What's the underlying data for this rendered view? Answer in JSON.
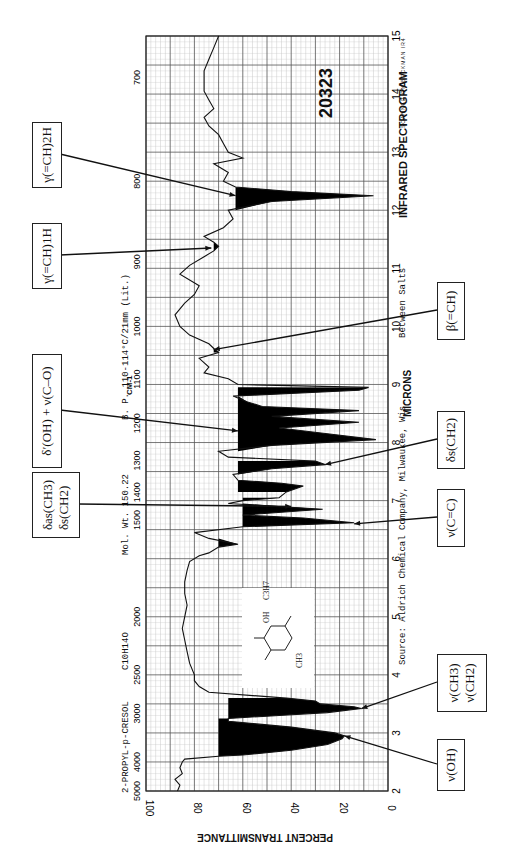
{
  "header": {
    "catalog_number": "20323",
    "title": "INFRARED SPECTROGRAM",
    "instrument": "SCANNED ON BECKMAN IR4",
    "compound": "2-PROPYL-p-CRESOL",
    "formula": "C10H14O",
    "mol_wt": "Mol. Wt. 150.22",
    "bp": "B. P. 110-114°C/21mm (Lit.)",
    "sample": "Between Salts",
    "source": "Source: Aldrich Chemical Company, Milwaukee, Wis."
  },
  "structure": {
    "substituents": [
      "OH",
      "C3H7",
      "CH3"
    ]
  },
  "annotations": [
    {
      "id": "gamma-ch-2h",
      "label": "γ(=CH)2H",
      "micron": 12.25,
      "T": 63
    },
    {
      "id": "gamma-ch-1h",
      "label": "γ(=CH)1H",
      "micron": 11.35,
      "T": 73
    },
    {
      "id": "delta-oh-nu-co",
      "label": "δ′(OH) + ν(C–O)",
      "micron": 8.2,
      "T": 62
    },
    {
      "id": "delta-as-ch3",
      "label": "δas(CH3)",
      "label2": "δs(CH2)",
      "micron": 6.9,
      "T": 40
    },
    {
      "id": "beta-ch",
      "label": "β(=CH)",
      "micron": 9.6,
      "T": 72
    },
    {
      "id": "delta-s-ch2",
      "label": "δs(CH2)",
      "micron": 7.62,
      "T": 26
    },
    {
      "id": "nu-cc",
      "label": "ν(C=C)",
      "micron": 6.6,
      "T": 14
    },
    {
      "id": "nu-ch3-ch2",
      "label": "ν(CH3)",
      "label2": "ν(CH2)",
      "micron": 3.42,
      "T": 11
    },
    {
      "id": "nu-oh",
      "label": "ν(OH)",
      "micron": 2.95,
      "T": 18
    }
  ],
  "chart_data": {
    "type": "line",
    "xlabel": "MICRONS",
    "x2label": "CM-1",
    "ylabel": "PERCENT TRANSMITTANCE",
    "xlim": [
      2,
      15
    ],
    "ylim": [
      0,
      100
    ],
    "micron_ticks": [
      2,
      3,
      4,
      5,
      6,
      7,
      8,
      9,
      10,
      11,
      12,
      13,
      14,
      15
    ],
    "wavenumber_ticks": [
      5000,
      4000,
      3000,
      2500,
      2000,
      1500,
      1400,
      1300,
      1200,
      1100,
      1000,
      900,
      800,
      700
    ],
    "percent_ticks": [
      100,
      80,
      60,
      40,
      20,
      0
    ],
    "grid": true,
    "series": [
      {
        "name": "Transmittance",
        "x": [
          2.0,
          2.1,
          2.2,
          2.3,
          2.4,
          2.5,
          2.55,
          2.6,
          2.62,
          2.7,
          2.8,
          2.9,
          2.95,
          3.0,
          3.1,
          3.2,
          3.25,
          3.3,
          3.35,
          3.42,
          3.45,
          3.5,
          3.55,
          3.6,
          3.7,
          3.8,
          3.9,
          4.0,
          4.2,
          4.4,
          4.6,
          4.8,
          5.0,
          5.2,
          5.4,
          5.6,
          5.8,
          5.95,
          6.05,
          6.1,
          6.2,
          6.25,
          6.35,
          6.45,
          6.55,
          6.62,
          6.7,
          6.75,
          6.85,
          6.95,
          7.0,
          7.05,
          7.15,
          7.25,
          7.3,
          7.35,
          7.45,
          7.55,
          7.62,
          7.68,
          7.75,
          7.85,
          7.95,
          8.05,
          8.15,
          8.25,
          8.35,
          8.45,
          8.55,
          8.62,
          8.7,
          8.8,
          8.9,
          8.95,
          9.0,
          9.1,
          9.2,
          9.3,
          9.45,
          9.55,
          9.62,
          9.7,
          9.85,
          10.0,
          10.2,
          10.4,
          10.55,
          10.7,
          10.9,
          11.05,
          11.2,
          11.3,
          11.38,
          11.45,
          11.55,
          11.7,
          11.85,
          12.0,
          12.15,
          12.25,
          12.32,
          12.4,
          12.5,
          12.65,
          12.8,
          12.9,
          13.0,
          13.15,
          13.3,
          13.45,
          13.6,
          13.75,
          13.9,
          14.05,
          14.2,
          14.4,
          14.6,
          14.8,
          15.0
        ],
        "y": [
          87,
          86,
          88,
          85,
          86,
          85,
          84,
          70,
          60,
          40,
          25,
          19,
          18,
          22,
          40,
          66,
          66,
          45,
          25,
          11,
          14,
          28,
          30,
          42,
          74,
          78,
          80,
          80,
          82,
          83,
          84,
          85,
          84,
          83,
          84,
          84,
          83,
          82,
          78,
          74,
          70,
          62,
          74,
          80,
          60,
          14,
          35,
          60,
          27,
          66,
          60,
          45,
          42,
          35,
          44,
          62,
          64,
          48,
          26,
          30,
          66,
          70,
          48,
          5,
          25,
          45,
          12,
          48,
          12,
          52,
          58,
          64,
          12,
          8,
          62,
          66,
          76,
          74,
          78,
          70,
          72,
          74,
          82,
          86,
          88,
          84,
          80,
          78,
          86,
          82,
          76,
          72,
          70,
          72,
          76,
          68,
          64,
          66,
          48,
          6,
          40,
          63,
          68,
          66,
          72,
          60,
          66,
          68,
          70,
          74,
          76,
          72,
          74,
          76,
          76,
          76,
          74,
          72,
          70
        ]
      }
    ]
  }
}
